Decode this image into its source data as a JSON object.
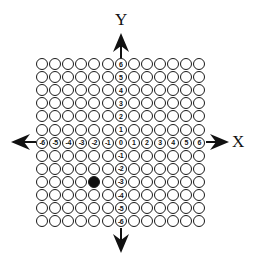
{
  "diagram": {
    "x_axis_label": "X",
    "y_axis_label": "Y",
    "grid": {
      "columns": 13,
      "rows": 13,
      "x_range": [
        -6,
        6
      ],
      "y_range": [
        -6,
        6
      ]
    },
    "x_axis_ticks": [
      "-6",
      "-5",
      "-4",
      "-3",
      "-2",
      "-1",
      "0",
      "1",
      "2",
      "3",
      "4",
      "5",
      "6"
    ],
    "y_axis_ticks": [
      "6",
      "5",
      "4",
      "3",
      "2",
      "1",
      "0",
      "-1",
      "-2",
      "-3",
      "-4",
      "-5",
      "-6"
    ],
    "filled_point": {
      "x": -2,
      "y": -3
    },
    "colors": {
      "line": "#1a1a1a",
      "fill": "#111111",
      "background": "#ffffff"
    }
  }
}
